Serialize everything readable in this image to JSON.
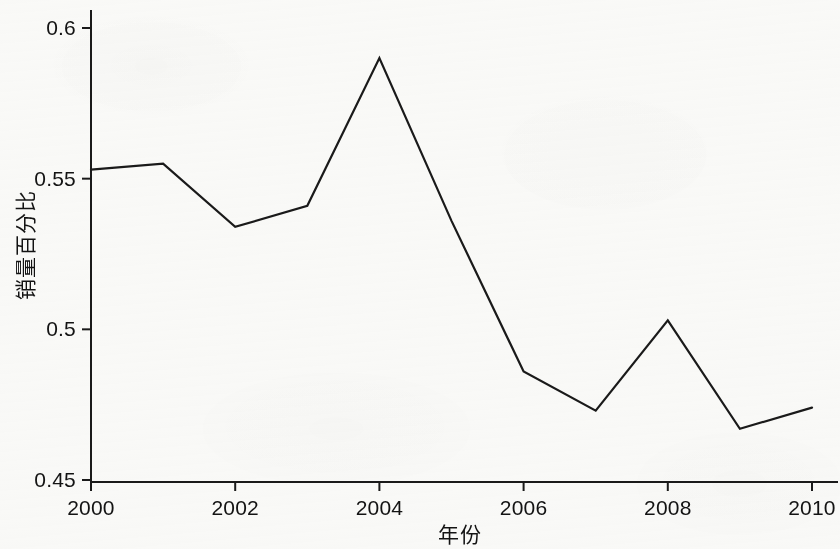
{
  "chart_data": {
    "type": "line",
    "title": "",
    "xlabel": "年份",
    "ylabel": "销量百分比",
    "x": [
      2000,
      2001,
      2002,
      2003,
      2004,
      2005,
      2006,
      2007,
      2008,
      2009,
      2010
    ],
    "values": [
      0.553,
      0.555,
      0.534,
      0.541,
      0.59,
      0.536,
      0.486,
      0.473,
      0.503,
      0.467,
      0.474
    ],
    "series": [
      {
        "name": "销量百分比",
        "values": [
          0.553,
          0.555,
          0.534,
          0.541,
          0.59,
          0.536,
          0.486,
          0.473,
          0.503,
          0.467,
          0.474
        ]
      }
    ],
    "categories": [
      "2000",
      "2001",
      "2002",
      "2003",
      "2004",
      "2005",
      "2006",
      "2007",
      "2008",
      "2009",
      "2010"
    ],
    "xlim": [
      2000,
      2010
    ],
    "ylim": [
      0.45,
      0.605
    ],
    "xticks": [
      2000,
      2002,
      2004,
      2006,
      2008,
      2010
    ],
    "yticks": [
      0.45,
      0.5,
      0.55,
      0.6
    ],
    "xtick_labels": [
      "2000",
      "2002",
      "2004",
      "2006",
      "2008",
      "2010"
    ],
    "ytick_labels": [
      "0.45",
      "0.5",
      "0.55",
      "0.6"
    ],
    "grid": false,
    "legend": null,
    "line_color": "#1a1a1a",
    "line_width": 2.2,
    "markers": false,
    "axis_color": "#1a1a1a",
    "background_color": "#fcfcfb"
  },
  "axes": {
    "y_title": "销量百分比",
    "x_title": "年份",
    "y_ticks": [
      {
        "label": "0.6",
        "value": 0.6
      },
      {
        "label": "0.55",
        "value": 0.55
      },
      {
        "label": "0.5",
        "value": 0.5
      },
      {
        "label": "0.45",
        "value": 0.45
      }
    ],
    "x_ticks": [
      {
        "label": "2000",
        "value": 2000
      },
      {
        "label": "2002",
        "value": 2002
      },
      {
        "label": "2004",
        "value": 2004
      },
      {
        "label": "2006",
        "value": 2006
      },
      {
        "label": "2008",
        "value": 2008
      },
      {
        "label": "2010",
        "value": 2010
      }
    ]
  }
}
